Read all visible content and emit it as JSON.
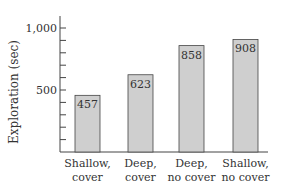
{
  "chart_data": {
    "type": "bar",
    "title": "",
    "xlabel": "",
    "ylabel": "Exploration (sec)",
    "ylim": [
      0,
      1100
    ],
    "yticks_labeled": [
      500,
      1000
    ],
    "ytick_labels": [
      "500",
      "1,000"
    ],
    "minor_tick_step": 100,
    "grid": false,
    "legend": null,
    "categories": [
      "Shallow, cover",
      "Deep, cover",
      "Deep, no cover",
      "Shallow, no cover"
    ],
    "category_lines": [
      [
        "Shallow,",
        "cover"
      ],
      [
        "Deep,",
        "cover"
      ],
      [
        "Deep,",
        "no cover"
      ],
      [
        "Shallow,",
        "no cover"
      ]
    ],
    "values": [
      457,
      623,
      858,
      908
    ],
    "value_labels": [
      "457",
      "623",
      "858",
      "908"
    ],
    "colors": {
      "bar_fill": "#cfcfcf",
      "bar_stroke": "#444444",
      "axis": "#444444",
      "text": "#333333"
    }
  }
}
